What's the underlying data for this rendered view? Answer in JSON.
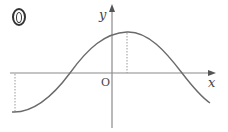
{
  "figure": {
    "problem_number": "0",
    "axis_labels": {
      "x": "x",
      "y": "y",
      "origin": "O"
    },
    "curve": {
      "description": "cosine-like wave: minimum at left edge, crosses x-axis left of origin, maximum just right of y-axis, crosses x-axis again on right, descending at right edge",
      "left_minimum": {
        "px": [
          14,
          112
        ]
      },
      "zero_crossing_left": {
        "px": [
          70,
          73
        ]
      },
      "maximum": {
        "px": [
          127,
          32
        ]
      },
      "zero_crossing_right": {
        "px": [
          182,
          73
        ]
      },
      "right_end": {
        "px": [
          210,
          102
        ]
      }
    },
    "guide_lines": [
      {
        "type": "dotted-vertical",
        "from_px": [
          14,
          73
        ],
        "to_px": [
          14,
          112
        ],
        "note": "drop from x-axis to left minimum"
      },
      {
        "type": "dotted-vertical",
        "from_px": [
          127,
          32
        ],
        "to_px": [
          127,
          73
        ],
        "note": "drop from maximum to x-axis"
      }
    ],
    "colors": {
      "axis": "#888888",
      "curve": "#666666",
      "guide": "#999999",
      "text": "#444444"
    }
  }
}
